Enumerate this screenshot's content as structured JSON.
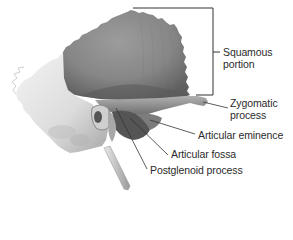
{
  "diagram": {
    "colors": {
      "background": "#ffffff",
      "squamous_fill": "#8a8a8a",
      "squamous_shadow": "#6c6c6c",
      "petrous_fill": "#e4e4e4",
      "petrous_shadow": "#b9b9b9",
      "zygomatic_fill": "#9a9a9a",
      "fossa_fill": "#5e5e5e",
      "leader_line": "#333333",
      "label_text": "#2b2b2b"
    },
    "labels": [
      {
        "id": "squamous",
        "line1": "Squamous",
        "line2": "portion"
      },
      {
        "id": "zygomatic",
        "line1": "Zygomatic",
        "line2": "process"
      },
      {
        "id": "articular-eminence",
        "line1": "Articular eminence"
      },
      {
        "id": "articular-fossa",
        "line1": "Articular fossa"
      },
      {
        "id": "postglenoid",
        "line1": "Postglenoid process"
      }
    ]
  }
}
